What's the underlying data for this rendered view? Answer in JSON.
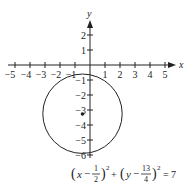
{
  "figure": {
    "type": "circle-graph",
    "x_axis_label": "x",
    "y_axis_label": "y",
    "x_ticks": [
      "−5",
      "−4",
      "−3",
      "−2",
      "−1",
      "1",
      "2",
      "3",
      "4",
      "5"
    ],
    "y_ticks": [
      "2",
      "1",
      "−1",
      "−2",
      "−3",
      "−4",
      "−5",
      "−6"
    ],
    "circle": {
      "center": [
        -0.5,
        -3.25
      ],
      "radius_squared": 7
    },
    "equation": {
      "term1_open": "(",
      "term1_var": "x",
      "term1_minus": "−",
      "term1_num": "1",
      "term1_den": "2",
      "term1_close": ")",
      "exp1": "2",
      "plus": "+",
      "term2_open": "(",
      "term2_var": "y",
      "term2_minus": "−",
      "term2_num": "13",
      "term2_den": "4",
      "term2_close": ")",
      "exp2": "2",
      "equals": "=",
      "rhs": "7"
    },
    "colors": {
      "ink": "#222222",
      "background": "#ffffff"
    }
  }
}
